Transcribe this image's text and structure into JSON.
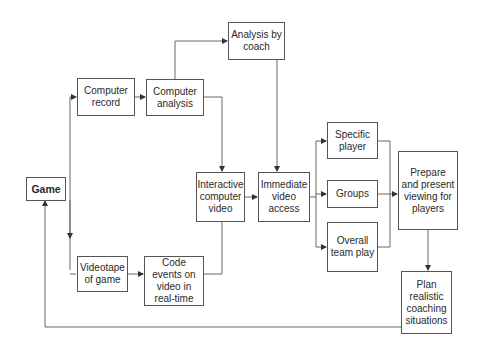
{
  "diagram": {
    "type": "flowchart",
    "nodes": {
      "game": {
        "label": "Game"
      },
      "computer_record": {
        "label": "Computer record"
      },
      "computer_analysis": {
        "label": "Computer analysis"
      },
      "analysis_by_coach": {
        "label": "Analysis by coach"
      },
      "interactive_video": {
        "label": "Interactive computer video"
      },
      "immediate_access": {
        "label": "Immediate video access"
      },
      "videotape": {
        "label": "Videotape of game"
      },
      "code_events": {
        "label": "Code events on video in real-time"
      },
      "specific_player": {
        "label": "Specific player"
      },
      "groups": {
        "label": "Groups"
      },
      "overall_team": {
        "label": "Overall team play"
      },
      "prepare_viewing": {
        "label": "Prepare and present viewing for players"
      },
      "plan_coaching": {
        "label": "Plan realistic coaching situations"
      }
    },
    "edges": [
      {
        "from": "game",
        "to": "computer_record"
      },
      {
        "from": "game",
        "to": "videotape"
      },
      {
        "from": "computer_record",
        "to": "computer_analysis"
      },
      {
        "from": "computer_analysis",
        "to": "analysis_by_coach"
      },
      {
        "from": "computer_analysis",
        "to": "interactive_video"
      },
      {
        "from": "code_events",
        "to": "interactive_video"
      },
      {
        "from": "videotape",
        "to": "code_events"
      },
      {
        "from": "analysis_by_coach",
        "to": "immediate_access"
      },
      {
        "from": "interactive_video",
        "to": "immediate_access"
      },
      {
        "from": "immediate_access",
        "to": "specific_player"
      },
      {
        "from": "immediate_access",
        "to": "groups"
      },
      {
        "from": "immediate_access",
        "to": "overall_team"
      },
      {
        "from": "specific_player",
        "to": "prepare_viewing"
      },
      {
        "from": "groups",
        "to": "prepare_viewing"
      },
      {
        "from": "overall_team",
        "to": "prepare_viewing"
      },
      {
        "from": "prepare_viewing",
        "to": "plan_coaching"
      },
      {
        "from": "plan_coaching",
        "to": "game"
      }
    ]
  },
  "colors": {
    "line": "#555555",
    "box_border": "#555555",
    "background": "#ffffff"
  }
}
